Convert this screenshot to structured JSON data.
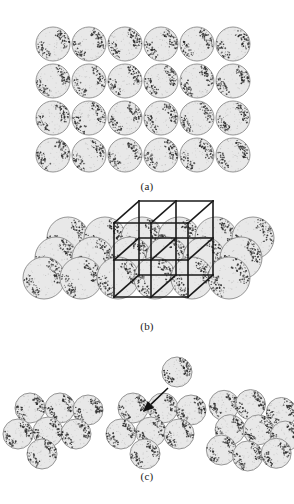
{
  "figure": {
    "background_color": "#ffffff",
    "width": 294,
    "height": 504
  },
  "style": {
    "sphere_fill": "#e8e8e8",
    "sphere_fill_light": "#ededed",
    "sphere_outline": "#8a8a8a",
    "stipple_color": "#2b2b2b",
    "speckle_color": "#9a9a9a",
    "wireframe_color": "#1a1a1a",
    "arrow_color": "#111111",
    "label_color": "#1a1a1a"
  },
  "panels": [
    {
      "id": "a",
      "label": "(a)",
      "type": "two-dimensional-sphere-array",
      "columns": 6,
      "rows": 4,
      "sphere_count": 24,
      "sphere_radius": 17,
      "column_pitch": 36,
      "row_pitch": 37,
      "origin_x": 53,
      "origin_y": 44
    },
    {
      "id": "b",
      "label": "(b)",
      "type": "three-dimensional-sphere-aggregate-with-unit-cell",
      "sphere_radius": 21,
      "rows": [
        {
          "name": "back-row",
          "count": 6,
          "origin_x": 68,
          "origin_y": 38,
          "pitch": 37
        },
        {
          "name": "middle-row",
          "count": 6,
          "origin_x": 56,
          "origin_y": 58,
          "pitch": 37
        },
        {
          "name": "front-row",
          "count": 6,
          "origin_x": 44,
          "origin_y": 78,
          "pitch": 37
        }
      ],
      "wireframe": {
        "name": "unit-cell-wireframe",
        "cells_x": 2,
        "cells_y": 2,
        "cells_z": 1,
        "cell_size": 37,
        "depth_offset_x": 25,
        "depth_offset_y": -22,
        "front_left_x": 114,
        "front_bottom_y": 97,
        "stroke_width": 1.6
      }
    },
    {
      "id": "c",
      "label": "(c)",
      "type": "sphere-cluster-group",
      "sphere_radius": 15,
      "clusters": [
        {
          "name": "left-cluster",
          "sphere_count": 7,
          "center_x": 44,
          "center_y": 78,
          "arrangement": "ordered"
        },
        {
          "name": "middle-cluster",
          "sphere_count": 7,
          "center_x": 147,
          "center_y": 78,
          "arrangement": "ordered",
          "has_detached_sphere": true,
          "detached_sphere": {
            "name": "incoming-sphere",
            "cx": 177,
            "cy": 22,
            "r": 15
          },
          "arrow": {
            "name": "incoming-sphere-arrow",
            "from_x": 168,
            "from_y": 38,
            "to_x": 143,
            "to_y": 62
          }
        },
        {
          "name": "right-cluster",
          "sphere_count": 9,
          "center_x": 250,
          "center_y": 78,
          "arrangement": "disordered"
        }
      ]
    }
  ]
}
